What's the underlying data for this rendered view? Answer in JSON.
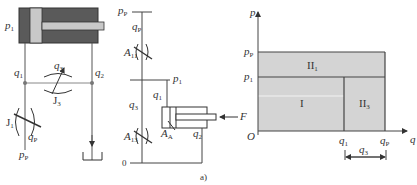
{
  "figure": {
    "caption": "a)",
    "left_circuit": {
      "cylinder_label": "p",
      "cylinder_label_sub": "1",
      "branch_left_flow": "q",
      "branch_left_flow_sub": "1",
      "branch_right_flow": "q",
      "branch_right_flow_sub": "2",
      "bypass_flow": "q",
      "bypass_flow_sub": "3",
      "bypass_valve": "J",
      "bypass_valve_sub": "3",
      "supply_valve": "J",
      "supply_valve_sub": "1",
      "supply_flow": "q",
      "supply_flow_sub": "P",
      "supply_pressure": "p",
      "supply_pressure_sub": "P"
    },
    "middle_circuit": {
      "supply_pressure": "p",
      "supply_pressure_sub": "P",
      "supply_flow": "q",
      "supply_flow_sub": "P",
      "upper_orifice": "A",
      "upper_orifice_sub": "11",
      "load_pressure": "p",
      "load_pressure_sub": "1",
      "flow_1": "q",
      "flow_1_sub": "1",
      "flow_3": "q",
      "flow_3_sub": "3",
      "piston_area": "A",
      "piston_area_sub": "A",
      "flow_2": "q",
      "flow_2_sub": "2",
      "lower_orifice": "A",
      "lower_orifice_sub": "13",
      "force": "F",
      "zero": "0"
    },
    "graph": {
      "y_axis": "p",
      "x_axis": "q",
      "origin": "O",
      "y_tick_pp": "p",
      "y_tick_pp_sub": "P",
      "y_tick_p1": "p",
      "y_tick_p1_sub": "1",
      "x_tick_q1": "q",
      "x_tick_q1_sub": "1",
      "x_tick_qp": "q",
      "x_tick_qp_sub": "P",
      "span_label": "q",
      "span_label_sub": "3",
      "region_I": "I",
      "region_II1": "II",
      "region_II1_sub": "1",
      "region_II3": "II",
      "region_II3_sub": "3",
      "fill_color": "#d4d4d4"
    }
  }
}
